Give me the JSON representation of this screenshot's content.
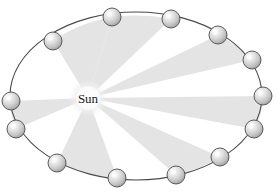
{
  "figure": {
    "name": "keplers-equal-area-law-diagram",
    "sun_label": "Sun",
    "background_color": "#ffffff",
    "orbit": {
      "center_x": 136,
      "center_y": 96,
      "radius_x": 126,
      "radius_y": 84,
      "stroke_color": "#4a4a4a",
      "stroke_width": 1.1,
      "fill": "none"
    },
    "sun": {
      "center_x": 88,
      "center_y": 98,
      "radius": 19,
      "glow_color": "#ededed",
      "core_color": "#fbfbfb"
    },
    "sector_fill": "#e4e4e4",
    "planet": {
      "radius": 9,
      "stroke_color": "#5a5a5a",
      "stroke_width": 1,
      "highlight_color": "#fcfcfc",
      "mid_color": "#d8d8d8",
      "shadow_color": "#9a9a9a"
    },
    "planets": [
      {
        "id": 1,
        "name": "planet-1",
        "cx": 112,
        "cy": 17,
        "angle_deg": 265
      },
      {
        "id": 2,
        "name": "planet-2",
        "cx": 171,
        "cy": 19,
        "angle_deg": 287
      },
      {
        "id": 3,
        "name": "planet-3",
        "cx": 218,
        "cy": 35,
        "angle_deg": 310
      },
      {
        "id": 4,
        "name": "planet-4",
        "cx": 252,
        "cy": 60,
        "angle_deg": 334
      },
      {
        "id": 5,
        "name": "planet-5",
        "cx": 263,
        "cy": 96,
        "angle_deg": 359
      },
      {
        "id": 6,
        "name": "planet-6",
        "cx": 254,
        "cy": 129,
        "angle_deg": 23
      },
      {
        "id": 7,
        "name": "planet-7",
        "cx": 220,
        "cy": 157,
        "angle_deg": 47
      },
      {
        "id": 8,
        "name": "planet-8",
        "cx": 176,
        "cy": 175,
        "angle_deg": 70
      },
      {
        "id": 9,
        "name": "planet-9",
        "cx": 117,
        "cy": 178,
        "angle_deg": 98
      },
      {
        "id": 10,
        "name": "planet-10",
        "cx": 57,
        "cy": 163,
        "angle_deg": 127
      },
      {
        "id": 11,
        "name": "planet-11",
        "cx": 16,
        "cy": 129,
        "angle_deg": 158
      },
      {
        "id": 12,
        "name": "planet-12",
        "cx": 11,
        "cy": 101,
        "angle_deg": 182
      },
      {
        "id": 13,
        "name": "planet-13",
        "cx": 53,
        "cy": 41,
        "angle_deg": 221
      }
    ],
    "sectors": [
      {
        "id": 1,
        "name": "swept-sector-1",
        "from_planet": 1,
        "to_planet": 2
      },
      {
        "id": 2,
        "name": "swept-sector-2",
        "from_planet": 3,
        "to_planet": 4
      },
      {
        "id": 3,
        "name": "swept-sector-3",
        "from_planet": 5,
        "to_planet": 6
      },
      {
        "id": 4,
        "name": "swept-sector-4",
        "from_planet": 7,
        "to_planet": 8
      },
      {
        "id": 5,
        "name": "swept-sector-5",
        "from_planet": 9,
        "to_planet": 10
      },
      {
        "id": 6,
        "name": "swept-sector-6",
        "from_planet": 11,
        "to_planet": 12
      },
      {
        "id": 7,
        "name": "swept-sector-7",
        "from_planet": 13,
        "to_planet": 1
      }
    ]
  }
}
